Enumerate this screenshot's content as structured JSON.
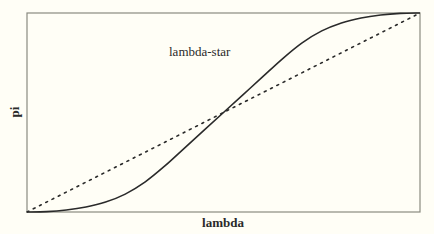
{
  "chart_data": {
    "type": "line",
    "title": "",
    "xlabel": "lambda",
    "ylabel": "pi",
    "xlim": [
      0,
      1
    ],
    "ylim": [
      0,
      1
    ],
    "grid": false,
    "legend": null,
    "annotations": [
      {
        "text": "lambda-star",
        "x": 0.37,
        "y": 0.79,
        "points_to": "solid S-curve"
      }
    ],
    "series": [
      {
        "name": "lambda-star",
        "style": "solid",
        "color": "#2a2a2a",
        "x": [
          0.0,
          0.05,
          0.1,
          0.15,
          0.2,
          0.25,
          0.3,
          0.35,
          0.4,
          0.45,
          0.5,
          0.55,
          0.6,
          0.65,
          0.7,
          0.75,
          0.8,
          0.85,
          0.9,
          0.95,
          1.0
        ],
        "y": [
          0.0,
          0.002,
          0.01,
          0.025,
          0.05,
          0.09,
          0.15,
          0.23,
          0.32,
          0.41,
          0.5,
          0.59,
          0.68,
          0.77,
          0.85,
          0.91,
          0.95,
          0.975,
          0.99,
          0.998,
          1.0
        ]
      },
      {
        "name": "diagonal",
        "style": "dotted",
        "color": "#2a2a2a",
        "x": [
          0.0,
          1.0
        ],
        "y": [
          0.0,
          1.0
        ]
      }
    ]
  },
  "plot": {
    "left": 27,
    "top": 13,
    "right": 420,
    "bottom": 212,
    "frame_color": "#8a8a80",
    "background": "#fffef6"
  },
  "labels": {
    "xlabel": "lambda",
    "ylabel": "pi",
    "annotation": "lambda-star"
  }
}
